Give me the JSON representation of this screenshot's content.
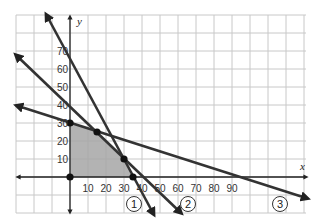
{
  "chart_data": {
    "type": "line",
    "title": "",
    "xlabel": "x",
    "ylabel": "y",
    "xlim": [
      -30,
      130
    ],
    "ylim": [
      -20,
      90
    ],
    "grid": true,
    "x_ticks": [
      10,
      20,
      30,
      40,
      50,
      60,
      70,
      80,
      90
    ],
    "y_ticks": [
      10,
      20,
      30,
      40,
      50,
      60,
      70
    ],
    "series": [
      {
        "name": "1",
        "equation": "2x + y = 70",
        "points": [
          [
            0,
            70
          ],
          [
            35,
            0
          ]
        ]
      },
      {
        "name": "2",
        "equation": "x + y = 40",
        "points": [
          [
            0,
            40
          ],
          [
            40,
            0
          ]
        ]
      },
      {
        "name": "3",
        "equation": "x + 3y = 90",
        "points": [
          [
            0,
            30
          ],
          [
            90,
            0
          ]
        ]
      }
    ],
    "feasible_region": [
      [
        0,
        0
      ],
      [
        0,
        30
      ],
      [
        15,
        25
      ],
      [
        30,
        10
      ],
      [
        35,
        0
      ]
    ],
    "marked_points": [
      [
        0,
        0
      ],
      [
        0,
        30
      ],
      [
        15,
        25
      ],
      [
        30,
        10
      ],
      [
        35,
        0
      ]
    ],
    "line_labels": [
      "1",
      "2",
      "3"
    ]
  },
  "labels": {
    "x_axis": "x",
    "y_axis": "y",
    "x_ticks": [
      "10",
      "20",
      "30",
      "40",
      "50",
      "60",
      "70",
      "80",
      "90"
    ],
    "y_ticks": [
      "10",
      "20",
      "30",
      "40",
      "50",
      "60",
      "70"
    ],
    "line1": "1",
    "line2": "2",
    "line3": "3"
  },
  "colors": {
    "grid": "#c8c8c8",
    "line": "#333333",
    "region": "#a6a6a6"
  }
}
